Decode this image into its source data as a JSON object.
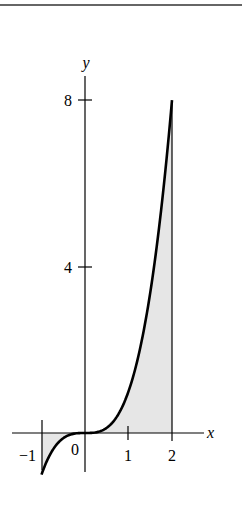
{
  "figure": {
    "function": "y = x^3",
    "x_axis_label": "x",
    "y_axis_label": "y",
    "x_ticks": [
      {
        "value": -1,
        "label": "−1"
      },
      {
        "value": 0,
        "label": "0"
      },
      {
        "value": 1,
        "label": "1"
      },
      {
        "value": 2,
        "label": "2"
      }
    ],
    "y_ticks": [
      {
        "value": 4,
        "label": "4"
      },
      {
        "value": 8,
        "label": "8"
      }
    ],
    "shaded_interval": [
      -1,
      2
    ],
    "shade_color": "#e6e6e6",
    "curve_color": "#000000"
  }
}
